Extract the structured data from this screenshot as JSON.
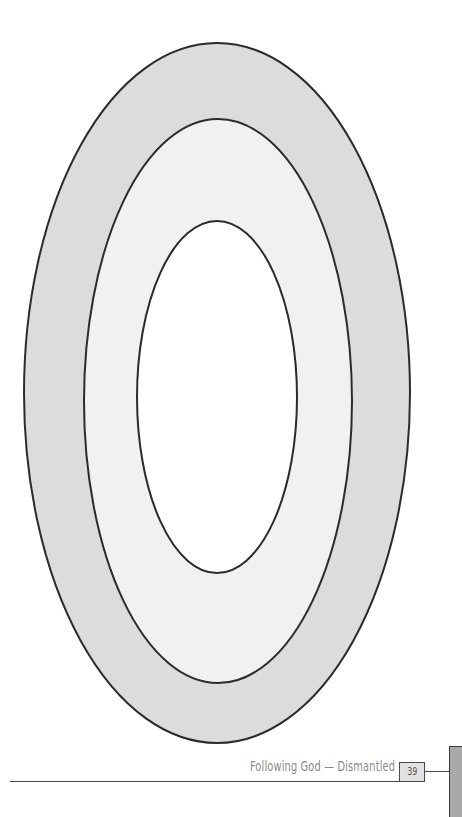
{
  "diagram": {
    "type": "concentric-ovals",
    "rings": [
      {
        "name": "outer",
        "cx": 217,
        "cy": 393,
        "rx": 193,
        "ry": 350,
        "fill": "#dcdcdc"
      },
      {
        "name": "middle",
        "cx": 218,
        "cy": 401,
        "rx": 134,
        "ry": 282,
        "fill": "#f1f1f1"
      },
      {
        "name": "inner",
        "cx": 217,
        "cy": 397,
        "rx": 80,
        "ry": 176,
        "fill": "#ffffff"
      }
    ],
    "stroke": "#2b2b2b"
  },
  "footer": {
    "title": "Following God — Dismantled",
    "page_number": "39"
  }
}
